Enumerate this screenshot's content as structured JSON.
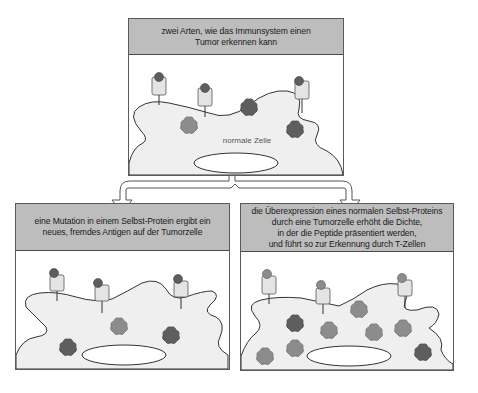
{
  "diagram": {
    "top_panel": {
      "title": "zwei Arten, wie das Immunsystem einen\nTumor erkennen kann",
      "cell_label": "normale Zelle",
      "receptors": 3,
      "peptides": [
        {
          "shade": "medium",
          "color": "#8c8c8c"
        },
        {
          "shade": "dark",
          "color": "#5e5e5e"
        },
        {
          "shade": "dark",
          "color": "#5e5e5e"
        }
      ]
    },
    "left_panel": {
      "title": "eine Mutation in einem Selbst-Protein ergibt ein\nneues, fremdes Antigen auf der Tumorzelle",
      "receptors": 3,
      "peptides": [
        {
          "shade": "medium",
          "color": "#8c8c8c"
        },
        {
          "shade": "dark",
          "color": "#5e5e5e"
        },
        {
          "shade": "dark",
          "color": "#5e5e5e"
        }
      ]
    },
    "right_panel": {
      "title": "die Überexpression eines normalen Selbst-Proteins\ndurch eine Tumorzelle erhöht die Dichte,\nin der die Peptide präsentiert werden,\nund führt so zur Erkennung durch T-Zellen",
      "receptors": 3,
      "peptides": [
        {
          "shade": "dark",
          "color": "#5e5e5e"
        },
        {
          "shade": "medium",
          "color": "#8c8c8c"
        },
        {
          "shade": "medium",
          "color": "#8c8c8c"
        },
        {
          "shade": "medium",
          "color": "#8c8c8c"
        },
        {
          "shade": "medium",
          "color": "#8c8c8c"
        },
        {
          "shade": "medium",
          "color": "#8c8c8c"
        },
        {
          "shade": "medium",
          "color": "#8c8c8c"
        },
        {
          "shade": "dark",
          "color": "#5e5e5e"
        }
      ]
    },
    "colors": {
      "header_bg": "#bdbdbd",
      "cell_fill": "#efefef",
      "receptor_fill": "#e4e4e4",
      "peptide_dark": "#5e5e5e",
      "peptide_medium": "#8c8c8c",
      "outline": "#333333"
    }
  }
}
